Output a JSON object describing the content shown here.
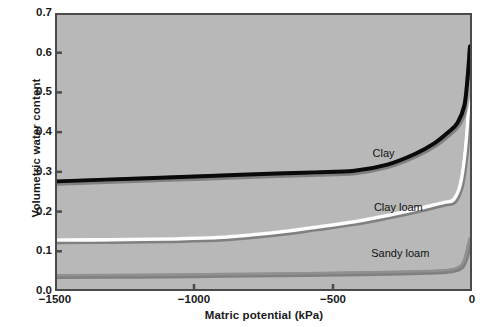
{
  "chart_data": {
    "type": "line",
    "title": "",
    "xlabel": "Matric potential (kPa)",
    "ylabel": "Volumetric water content",
    "xlim": [
      -1500,
      0
    ],
    "ylim": [
      0.0,
      0.7
    ],
    "xticks": [
      -1500,
      -1000,
      -500,
      0
    ],
    "xtick_labels": [
      "−1500",
      "−1000",
      "−500",
      "0"
    ],
    "yticks": [
      0.0,
      0.1,
      0.2,
      0.3,
      0.4,
      0.5,
      0.6,
      0.7
    ],
    "ytick_labels": [
      "0.0",
      "0.1",
      "0.2",
      "0.3",
      "0.4",
      "0.5",
      "0.6",
      "0.7"
    ],
    "grid": false,
    "legend_position": "inline-annotations",
    "plot_background_color": "#b8b8b8",
    "figure_background_color": "#ffffff",
    "axis_color": "#4a4a4a",
    "series": [
      {
        "name": "Clay",
        "color": "#0a0a0a",
        "line_width": 4.0,
        "label_x": -318,
        "label_y": 0.345,
        "x": [
          -1500,
          -1300,
          -1100,
          -900,
          -700,
          -560,
          -420,
          -300,
          -200,
          -130,
          -80,
          -45,
          -20,
          -8,
          0
        ],
        "values": [
          0.275,
          0.28,
          0.285,
          0.29,
          0.295,
          0.298,
          0.302,
          0.318,
          0.345,
          0.372,
          0.4,
          0.425,
          0.47,
          0.545,
          0.62
        ]
      },
      {
        "name": "Clay loam",
        "color": "#fdfdfd",
        "line_width": 3.6,
        "label_x": -265,
        "label_y": 0.208,
        "x": [
          -1500,
          -1300,
          -1100,
          -900,
          -700,
          -560,
          -420,
          -300,
          -200,
          -130,
          -90,
          -60,
          -35,
          -18,
          -6,
          0
        ],
        "values": [
          0.125,
          0.126,
          0.128,
          0.132,
          0.145,
          0.158,
          0.172,
          0.188,
          0.203,
          0.215,
          0.222,
          0.228,
          0.268,
          0.35,
          0.455,
          0.53
        ]
      },
      {
        "name": "Sandy loam",
        "color": "#909090",
        "line_width": 2.6,
        "label_x": -258,
        "label_y": 0.093,
        "x": [
          -1500,
          -1200,
          -900,
          -600,
          -400,
          -250,
          -150,
          -90,
          -55,
          -30,
          -16,
          -7,
          0
        ],
        "values": [
          0.035,
          0.036,
          0.038,
          0.04,
          0.042,
          0.044,
          0.046,
          0.048,
          0.052,
          0.062,
          0.085,
          0.112,
          0.13
        ]
      }
    ]
  }
}
